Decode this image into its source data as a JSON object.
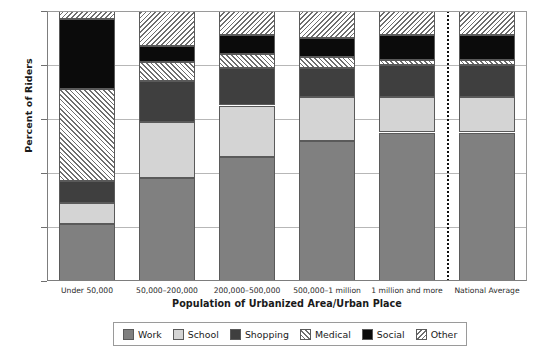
{
  "chart_data": {
    "type": "bar",
    "subtype": "stacked-bar-100-percent",
    "title": "",
    "xlabel": "Population of Urbanized Area/Urban Place",
    "ylabel": "Percent of Riders",
    "ylim": [
      0,
      100
    ],
    "ytick_labels": [
      "0%",
      "20%",
      "40%",
      "60%",
      "80%",
      "100%"
    ],
    "ytick_values": [
      0,
      20,
      40,
      60,
      80,
      100
    ],
    "grid": true,
    "legend_position": "bottom",
    "categories": [
      "Under 50,000",
      "50,000–200,000",
      "200,000–500,000",
      "500,000–1 million",
      "1 million and more",
      "National Average"
    ],
    "series": [
      {
        "name": "Work",
        "color": "#808080",
        "pattern": "solid",
        "values": [
          21,
          38,
          46,
          52,
          55,
          55
        ]
      },
      {
        "name": "School",
        "color": "#d4d4d4",
        "pattern": "solid",
        "values": [
          8,
          21,
          19,
          16,
          13,
          13
        ]
      },
      {
        "name": "Shopping",
        "color": "#3f3f3f",
        "pattern": "solid",
        "values": [
          8,
          15,
          14,
          11,
          12,
          12
        ]
      },
      {
        "name": "Medical",
        "color": "#6e6e6e",
        "pattern": "hatch-45",
        "values": [
          34,
          7,
          5,
          4,
          2,
          2
        ]
      },
      {
        "name": "Social",
        "color": "#0b0b0b",
        "pattern": "solid",
        "values": [
          26,
          6,
          7,
          7,
          9,
          9
        ]
      },
      {
        "name": "Other",
        "color": "#6e6e6e",
        "pattern": "hatch-neg45",
        "values": [
          3,
          13,
          9,
          10,
          9,
          9
        ]
      }
    ],
    "annotations": [
      {
        "type": "vertical-dotted-divider",
        "before_category": "National Average"
      }
    ]
  },
  "legend": {
    "items": [
      {
        "label": "Work"
      },
      {
        "label": "School"
      },
      {
        "label": "Shopping"
      },
      {
        "label": "Medical"
      },
      {
        "label": "Social"
      },
      {
        "label": "Other"
      }
    ]
  }
}
